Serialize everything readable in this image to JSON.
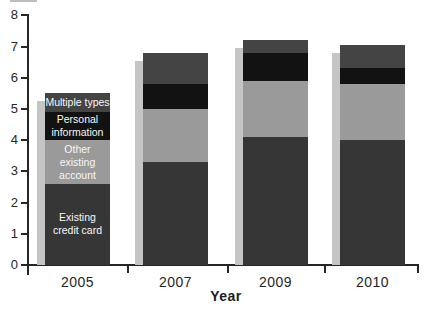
{
  "chart_data": {
    "type": "bar",
    "variant": "stacked-vertical",
    "title": "",
    "xlabel": "Year",
    "ylabel": "",
    "ylim": [
      0,
      8
    ],
    "yticks": [
      0,
      1,
      2,
      3,
      4,
      5,
      6,
      7,
      8
    ],
    "grid": false,
    "legend_position": "labels-inside-first-bar",
    "categories": [
      "2005",
      "2007",
      "2009",
      "2010"
    ],
    "series": [
      {
        "name": "Existing credit card",
        "label_lines": [
          "Existing",
          "credit card"
        ],
        "color": "#363636",
        "values": [
          2.6,
          3.3,
          4.1,
          4.0
        ]
      },
      {
        "name": "Other existing account",
        "label_lines": [
          "Other",
          "existing",
          "account"
        ],
        "color": "#9a9a9a",
        "values": [
          1.4,
          1.7,
          1.8,
          1.8
        ]
      },
      {
        "name": "Personal information",
        "label_lines": [
          "Personal",
          "information"
        ],
        "color": "#121212",
        "values": [
          0.9,
          0.8,
          0.9,
          0.5
        ]
      },
      {
        "name": "Multiple types",
        "label_lines": [
          "Multiple types"
        ],
        "color": "#444444",
        "values": [
          0.6,
          1.0,
          0.4,
          0.75
        ]
      }
    ],
    "totals": [
      5.5,
      6.8,
      7.2,
      7.05
    ],
    "colors": {
      "background": "#ffffff",
      "axis": "#262626",
      "bar_shadow": "#c5c5c5",
      "segment_label_text": "#f7f7f7",
      "top_rule": "#bdbdbd"
    }
  }
}
